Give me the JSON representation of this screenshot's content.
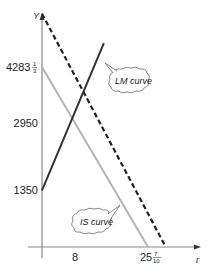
{
  "chart_data": {
    "type": "line",
    "title": "",
    "xlabel": "r",
    "ylabel": "Y",
    "xlim": [
      0,
      30
    ],
    "ylim": [
      0,
      5800
    ],
    "grid": false,
    "x_ticks": [
      {
        "value": 8,
        "label": "8"
      },
      {
        "value": 25.7,
        "label": "25",
        "frac_num": "7",
        "frac_den": "10"
      }
    ],
    "y_ticks": [
      {
        "value": 4283.333,
        "label": "4283",
        "frac_num": "1",
        "frac_den": "3"
      },
      {
        "value": 2950,
        "label": "2950"
      },
      {
        "value": 1350,
        "label": "1350"
      }
    ],
    "series": [
      {
        "name": "IS curve",
        "style": "solid",
        "color": "#b4b4b4",
        "points": [
          [
            0,
            4283.333
          ],
          [
            25.7,
            0
          ]
        ]
      },
      {
        "name": "LM curve",
        "style": "solid",
        "color": "#333333",
        "points": [
          [
            0,
            1350
          ],
          [
            15,
            4850
          ]
        ]
      },
      {
        "name": "Shifted IS curve",
        "style": "dashed",
        "color": "#222222",
        "points": [
          [
            0,
            5550
          ],
          [
            30,
            0
          ]
        ]
      }
    ],
    "annotations": [
      {
        "text": "LM curve",
        "points_to": "LM curve"
      },
      {
        "text": "IS curve",
        "points_to": "IS curve"
      }
    ]
  }
}
